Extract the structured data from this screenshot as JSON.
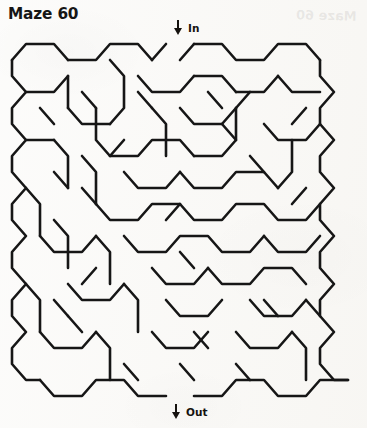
{
  "page": {
    "title": "Maze 60",
    "background_color": "#f8f7f4",
    "ink_color": "#161616",
    "ghost_text": "Maze 60"
  },
  "entrance": {
    "label": "In",
    "arrow_icon": "down-arrow-icon",
    "x": 178,
    "y": 45
  },
  "exit": {
    "label": "Out",
    "arrow_icon": "down-arrow-icon",
    "x": 176,
    "y": 395
  },
  "maze": {
    "type": "hexagonal",
    "columns": 8,
    "rows": 11,
    "cell_width": 42,
    "cell_height": 32,
    "stroke_width": 2.6,
    "origin_x": 10,
    "origin_y": 45,
    "walls": [
      "M12,60 L12,76 L26,92 L12,108 L12,124 L26,140 L12,156 L12,172 L26,188 L12,204 L12,220 L26,236 L12,252 L12,268 L26,284 L12,300 L12,316 L26,332 L12,348 L12,364 L26,380 L40,380",
      "M12,60 L26,44 L54,44 L68,60",
      "M68,60 L96,60 L110,44 L138,44 L152,60",
      "M152,60 L166,44",
      "M194,44 L180,60",
      "M194,44 L222,44 L236,60 L264,60 L278,44 L306,44 L320,60",
      "M320,60 L320,76 L334,92 L320,108 L320,124 L334,140 L320,156 L320,172 L334,188 L320,204 L320,220 L334,236 L320,252 L320,268 L334,284 L320,300 L320,316 L334,332 L320,348 L320,364 L334,380 L348,380",
      "M40,380 L54,396 L82,396 L96,380 L124,380 L138,396 L166,396",
      "M194,396 L222,396 L236,380 L264,380 L278,396 L306,396 L320,380 L348,380",
      "M26,92 L54,92 L68,76",
      "M68,76 L68,108",
      "M68,108 L82,124 L110,124",
      "M110,124 L124,108 L124,76 L110,60",
      "M138,76 L152,92 L180,92 L194,76",
      "M194,76 L222,76 L236,92",
      "M236,92 L264,92 L278,76",
      "M278,76 L292,92 L320,92",
      "M26,140 L54,140",
      "M54,140 L68,156 L68,188",
      "M82,92 L96,108",
      "M96,108 L96,140 L110,156 L138,156 L152,140 L180,140 L194,156",
      "M194,156 L222,156 L236,140 L236,108",
      "M236,108 L250,92",
      "M264,124 L278,140 L306,140 L320,124",
      "M124,140 L110,156",
      "M152,108 L166,124 L166,156",
      "M180,108 L194,124 L222,124 L236,108",
      "M26,188 L40,204 L40,236",
      "M54,172 L68,188",
      "M82,156 L96,172 L96,204",
      "M96,204 L110,220 L138,220 L152,204 L180,204 L194,220 L222,220 L236,204 L264,204 L278,220 L306,220 L320,204",
      "M124,172 L138,188 L166,188 L180,172",
      "M180,172 L194,188 L222,188 L236,172 L264,172 L278,188",
      "M278,188 L292,172 L292,140",
      "M40,236 L54,252 L82,252 L96,236",
      "M96,236 L110,252 L110,284",
      "M124,236 L138,252 L166,252 L180,236 L208,236 L222,252 L250,252 L264,236",
      "M264,236 L278,252 L306,252 L320,236",
      "M54,220 L68,236 L68,268",
      "M152,268 L166,284 L194,284 L208,268",
      "M208,268 L222,284 L250,284 L264,268 L292,268 L306,284",
      "M26,284 L40,300 L40,332",
      "M68,284 L82,300 L110,300 L124,284",
      "M124,284 L138,300 L138,332",
      "M166,300 L180,316 L208,316 L222,300",
      "M250,300 L264,316 L292,316 L306,300",
      "M306,300 L320,316",
      "M40,332 L54,348 L82,348 L96,332",
      "M96,332 L110,348 L110,380",
      "M152,332 L166,348 L194,348 L208,332",
      "M236,332 L250,348 L278,348 L292,332",
      "M292,332 L306,348 L306,380",
      "M68,316 L82,332",
      "M180,252 L194,268",
      "M222,124 L236,140",
      "M250,156 L264,172",
      "M292,204 L306,188",
      "M138,92 L152,108",
      "M40,108 L54,124",
      "M82,188 L96,204",
      "M194,332 L208,348",
      "M124,364 L138,380",
      "M236,364 L250,380",
      "M264,300 L278,316",
      "M166,220 L180,204",
      "M208,92 L222,108",
      "M306,108 L292,124",
      "M54,300 L68,316",
      "M180,364 L194,380",
      "M96,268 L82,284"
    ]
  }
}
